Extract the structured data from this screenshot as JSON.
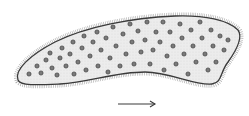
{
  "illustration": {
    "subject": "ciliated cell (paramecium-like) with granules",
    "colors": {
      "background": "#ffffff",
      "cell_fill": "#e9e9e9",
      "outline": "#3a3a3a",
      "cilia": "#8a8a8a",
      "granule_fill": "#7a7a7a",
      "granule_stroke": "#2e2e2e",
      "arrow": "#3a3a3a"
    },
    "direction_arrow": {
      "x1": 118,
      "y1": 104,
      "x2": 155,
      "y2": 104,
      "label": "direction of movement"
    }
  }
}
